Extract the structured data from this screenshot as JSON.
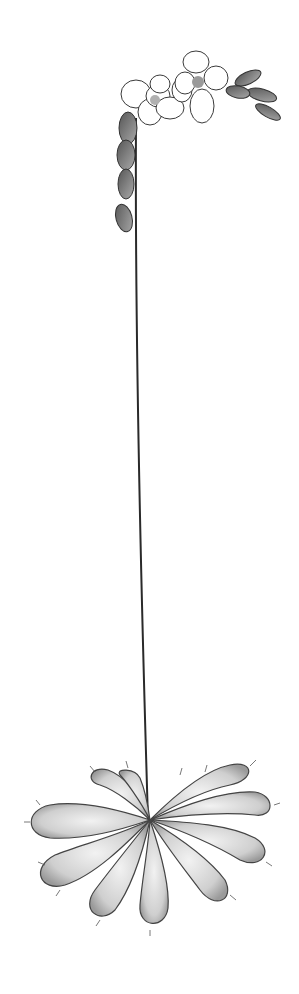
{
  "image": {
    "subject": "Botanical pencil drawing of a sundew plant",
    "description": "A tall single flowering stalk rising from a basal rosette of spatulate, glandular-haired leaves; the stalk curves at the top into a coiled inflorescence with several open white five-petaled flowers and dark buds.",
    "palette": {
      "background": "#ffffff",
      "stroke": "#2a2a2a",
      "shade": "#8a8a8a",
      "light_shade": "#d0d0d0"
    },
    "parts": {
      "inflorescence": "curled raceme with open flowers and buds",
      "stem": "long thin scape",
      "rosette": "basal rosette of hairy spoon-shaped leaves"
    }
  }
}
